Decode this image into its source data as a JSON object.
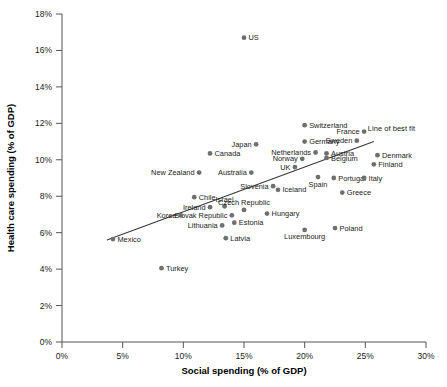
{
  "chart_data": {
    "type": "scatter",
    "title": "",
    "xlabel": "Social spending (% of GDP)",
    "ylabel": "Health care spending (% of GDP)",
    "xlim": [
      0,
      30
    ],
    "ylim": [
      0,
      18
    ],
    "xticks": [
      "0%",
      "5%",
      "10%",
      "15%",
      "20%",
      "25%",
      "30%"
    ],
    "xtick_values": [
      0,
      5,
      10,
      15,
      20,
      25,
      30
    ],
    "yticks": [
      "0%",
      "2%",
      "4%",
      "6%",
      "8%",
      "10%",
      "12%",
      "14%",
      "16%",
      "18%"
    ],
    "ytick_values": [
      0,
      2,
      4,
      6,
      8,
      10,
      12,
      14,
      16,
      18
    ],
    "grid": false,
    "legend": "none",
    "point_color": "#6f6f6f",
    "line_color": "#3a3a3a",
    "annotations": [
      {
        "text": "Line of best fit",
        "x": 25.2,
        "y": 11.6
      }
    ],
    "trendline": {
      "label": "Line of best fit",
      "x0": 3.7,
      "y0": 5.6,
      "x1": 25.7,
      "y1": 11.0
    },
    "points": [
      {
        "name": "US",
        "x": 15.0,
        "y": 16.7,
        "label_pos": "right"
      },
      {
        "name": "Switzerland",
        "x": 20.0,
        "y": 11.9,
        "label_pos": "right"
      },
      {
        "name": "France",
        "x": 24.9,
        "y": 11.55,
        "label_pos": "left"
      },
      {
        "name": "Germany",
        "x": 20.0,
        "y": 11.0,
        "label_pos": "right"
      },
      {
        "name": "Sweden",
        "x": 24.3,
        "y": 11.05,
        "label_pos": "left"
      },
      {
        "name": "Japan",
        "x": 16.0,
        "y": 10.85,
        "label_pos": "left"
      },
      {
        "name": "Netherlands",
        "x": 20.9,
        "y": 10.4,
        "label_pos": "left"
      },
      {
        "name": "Austria",
        "x": 21.8,
        "y": 10.35,
        "label_pos": "right"
      },
      {
        "name": "Canada",
        "x": 12.2,
        "y": 10.35,
        "label_pos": "right"
      },
      {
        "name": "Denmark",
        "x": 26.0,
        "y": 10.25,
        "label_pos": "right"
      },
      {
        "name": "Belgium",
        "x": 21.8,
        "y": 10.1,
        "label_pos": "right"
      },
      {
        "name": "Norway",
        "x": 19.8,
        "y": 10.05,
        "label_pos": "left"
      },
      {
        "name": "Finland",
        "x": 25.7,
        "y": 9.75,
        "label_pos": "right"
      },
      {
        "name": "UK",
        "x": 19.2,
        "y": 9.6,
        "label_pos": "left"
      },
      {
        "name": "New Zealand",
        "x": 11.3,
        "y": 9.3,
        "label_pos": "left"
      },
      {
        "name": "Australia",
        "x": 15.6,
        "y": 9.3,
        "label_pos": "left"
      },
      {
        "name": "Spain",
        "x": 21.1,
        "y": 9.05,
        "label_pos": "below"
      },
      {
        "name": "Portugal",
        "x": 22.4,
        "y": 9.0,
        "label_pos": "right"
      },
      {
        "name": "Italy",
        "x": 24.9,
        "y": 9.0,
        "label_pos": "right"
      },
      {
        "name": "Slovenia",
        "x": 17.4,
        "y": 8.55,
        "label_pos": "left"
      },
      {
        "name": "Iceland",
        "x": 17.8,
        "y": 8.35,
        "label_pos": "right"
      },
      {
        "name": "Greece",
        "x": 23.1,
        "y": 8.2,
        "label_pos": "right"
      },
      {
        "name": "Chile",
        "x": 10.9,
        "y": 7.95,
        "label_pos": "right"
      },
      {
        "name": "Israel",
        "x": 13.4,
        "y": 7.45,
        "label_pos": "above"
      },
      {
        "name": "Ireland",
        "x": 12.2,
        "y": 7.4,
        "label_pos": "left"
      },
      {
        "name": "Czech Republic",
        "x": 15.0,
        "y": 7.25,
        "label_pos": "above"
      },
      {
        "name": "Hungary",
        "x": 16.9,
        "y": 7.05,
        "label_pos": "right"
      },
      {
        "name": "Slovak Republic",
        "x": 14.0,
        "y": 6.95,
        "label_pos": "left"
      },
      {
        "name": "Korea",
        "x": 9.8,
        "y": 6.95,
        "label_pos": "left"
      },
      {
        "name": "Estonia",
        "x": 14.2,
        "y": 6.55,
        "label_pos": "right"
      },
      {
        "name": "Lithuania",
        "x": 13.2,
        "y": 6.4,
        "label_pos": "left"
      },
      {
        "name": "Poland",
        "x": 22.5,
        "y": 6.25,
        "label_pos": "right"
      },
      {
        "name": "Luxembourg",
        "x": 20.0,
        "y": 6.15,
        "label_pos": "below"
      },
      {
        "name": "Latvia",
        "x": 13.5,
        "y": 5.7,
        "label_pos": "right"
      },
      {
        "name": "Mexico",
        "x": 4.2,
        "y": 5.65,
        "label_pos": "right"
      },
      {
        "name": "Turkey",
        "x": 8.2,
        "y": 4.05,
        "label_pos": "right"
      }
    ]
  }
}
